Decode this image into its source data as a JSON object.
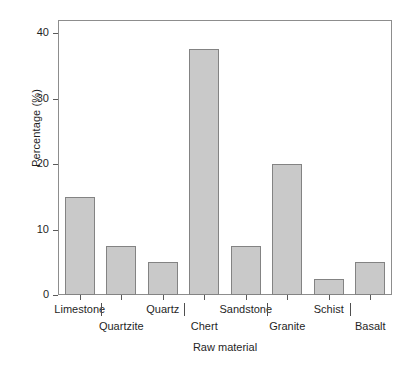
{
  "chart_data": {
    "type": "bar",
    "title": "",
    "xlabel": "Raw material",
    "ylabel": "Percentage (%)",
    "categories": [
      "Limestone",
      "Quartzite",
      "Quartz",
      "Chert",
      "Sandstone",
      "Granite",
      "Schist",
      "Basalt"
    ],
    "values": [
      15,
      7.5,
      5,
      37.5,
      7.5,
      20,
      2.5,
      5
    ],
    "ylim": [
      0,
      42
    ],
    "yticks": [
      0,
      10,
      20,
      30,
      40
    ],
    "ytick_labels": [
      "0",
      "10",
      "20",
      "30",
      "40"
    ],
    "grid": false,
    "legend": null,
    "bar_fill_color": "#c9c9c9",
    "bar_edge_color": "#838383",
    "axis_color": "#8d8d8d",
    "background_color": "#ffffff"
  },
  "axis": {
    "y_title": "Percentage (%)",
    "x_title": "Raw material"
  }
}
